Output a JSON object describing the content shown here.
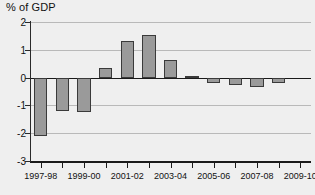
{
  "chart_data": {
    "type": "bar",
    "title": "% of GDP",
    "xlabel": "",
    "ylabel": "% of GDP",
    "ylim": [
      -3,
      2
    ],
    "yticks": [
      2,
      1,
      0,
      -1,
      -2,
      -3
    ],
    "ytick_labels": [
      "2",
      "1",
      "0",
      "-1",
      "-2",
      "-3"
    ],
    "grid": true,
    "legend": "none",
    "categories": [
      "1997-98",
      "1998-99",
      "1999-00",
      "2000-01",
      "2001-02",
      "2002-03",
      "2003-04",
      "2004-05",
      "2005-06",
      "2006-07",
      "2007-08",
      "2008-09",
      "2009-10"
    ],
    "xtick_labels_shown": [
      "1997-98",
      "1999-00",
      "2001-02",
      "2003-04",
      "2005-06",
      "2007-08",
      "2009-10"
    ],
    "values": [
      -2.1,
      -1.2,
      -1.25,
      0.35,
      1.3,
      1.55,
      0.65,
      0.05,
      -0.2,
      -0.25,
      -0.35,
      -0.2,
      0
    ],
    "bar_color": "#9a9a9a",
    "bar_edge_color": "#3a3a3a",
    "grid_color": "#b9b9b9",
    "axis_color": "#1a1a1a",
    "background_color": "#efefef"
  }
}
